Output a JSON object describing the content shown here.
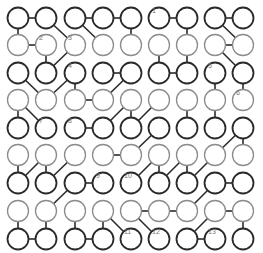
{
  "puzzle": {
    "cols": 9,
    "rows": 9,
    "col_x": [
      18,
      46,
      75,
      103,
      131,
      159,
      187,
      215,
      243
    ],
    "row_y": [
      18,
      45,
      73,
      100,
      128,
      155,
      183,
      211,
      239
    ],
    "radius": 10.5,
    "row_styles": [
      "dark",
      "light",
      "dark",
      "light",
      "dark",
      "light",
      "dark",
      "light",
      "dark"
    ],
    "colors": {
      "dark_stroke": "#2a2a2a",
      "light_stroke": "#8c8c8c",
      "edge": "#2b2b2b",
      "label": "#777777",
      "background": "#ffffff"
    },
    "labels": [
      {
        "text": "1",
        "r": 0,
        "c": 5
      },
      {
        "text": "2",
        "r": 1,
        "c": 1
      },
      {
        "text": "3",
        "r": 1,
        "c": 2
      },
      {
        "text": "4",
        "r": 2,
        "c": 2
      },
      {
        "text": "5",
        "r": 2,
        "c": 7
      },
      {
        "text": "6",
        "r": 3,
        "c": 8
      },
      {
        "text": "7",
        "r": 4,
        "c": 1
      },
      {
        "text": "8",
        "r": 4,
        "c": 2
      },
      {
        "text": "9",
        "r": 6,
        "c": 3
      },
      {
        "text": "10",
        "r": 6,
        "c": 4
      },
      {
        "text": "11",
        "r": 8,
        "c": 4
      },
      {
        "text": "12",
        "r": 8,
        "c": 5
      },
      {
        "text": "13",
        "r": 8,
        "c": 7
      }
    ],
    "edges": [
      [
        0,
        0,
        0,
        1
      ],
      [
        0,
        2,
        0,
        3
      ],
      [
        0,
        3,
        0,
        4
      ],
      [
        0,
        5,
        0,
        6
      ],
      [
        0,
        7,
        0,
        8
      ],
      [
        1,
        0,
        1,
        1
      ],
      [
        1,
        7,
        1,
        8
      ],
      [
        0,
        0,
        1,
        0
      ],
      [
        0,
        4,
        1,
        4
      ],
      [
        0,
        6,
        1,
        6
      ],
      [
        0,
        1,
        1,
        2
      ],
      [
        0,
        2,
        1,
        3
      ],
      [
        0,
        7,
        1,
        8
      ],
      [
        1,
        1,
        2,
        1
      ],
      [
        1,
        2,
        2,
        1
      ],
      [
        1,
        5,
        2,
        5
      ],
      [
        1,
        6,
        2,
        6
      ],
      [
        1,
        7,
        2,
        8
      ],
      [
        2,
        3,
        2,
        4
      ],
      [
        2,
        5,
        2,
        6
      ],
      [
        2,
        0,
        3,
        1
      ],
      [
        2,
        2,
        3,
        1
      ],
      [
        2,
        2,
        3,
        2
      ],
      [
        2,
        4,
        3,
        3
      ],
      [
        2,
        7,
        3,
        7
      ],
      [
        2,
        8,
        3,
        8
      ],
      [
        3,
        2,
        3,
        3
      ],
      [
        3,
        0,
        4,
        0
      ],
      [
        3,
        0,
        4,
        1
      ],
      [
        3,
        4,
        4,
        3
      ],
      [
        3,
        4,
        4,
        4
      ],
      [
        3,
        5,
        4,
        4
      ],
      [
        3,
        6,
        4,
        6
      ],
      [
        3,
        7,
        4,
        7
      ],
      [
        4,
        2,
        4,
        3
      ],
      [
        4,
        5,
        5,
        4
      ],
      [
        4,
        8,
        5,
        7
      ],
      [
        4,
        8,
        5,
        8
      ],
      [
        5,
        3,
        5,
        4
      ],
      [
        5,
        0,
        6,
        0
      ],
      [
        5,
        1,
        6,
        0
      ],
      [
        5,
        1,
        6,
        1
      ],
      [
        5,
        2,
        6,
        1
      ],
      [
        5,
        5,
        6,
        4
      ],
      [
        5,
        5,
        6,
        5
      ],
      [
        5,
        6,
        6,
        5
      ],
      [
        5,
        6,
        6,
        6
      ],
      [
        5,
        7,
        6,
        6
      ],
      [
        6,
        2,
        6,
        3
      ],
      [
        6,
        7,
        6,
        8
      ],
      [
        6,
        2,
        7,
        1
      ],
      [
        6,
        7,
        7,
        6
      ],
      [
        7,
        4,
        7,
        5
      ],
      [
        7,
        5,
        7,
        6
      ],
      [
        7,
        7,
        7,
        8
      ],
      [
        7,
        0,
        8,
        0
      ],
      [
        7,
        1,
        8,
        1
      ],
      [
        7,
        2,
        8,
        2
      ],
      [
        7,
        3,
        8,
        3
      ],
      [
        7,
        3,
        8,
        4
      ],
      [
        7,
        4,
        8,
        5
      ],
      [
        7,
        7,
        8,
        6
      ],
      [
        7,
        8,
        8,
        8
      ],
      [
        8,
        0,
        8,
        1
      ],
      [
        8,
        2,
        8,
        3
      ],
      [
        8,
        6,
        8,
        7
      ]
    ]
  }
}
